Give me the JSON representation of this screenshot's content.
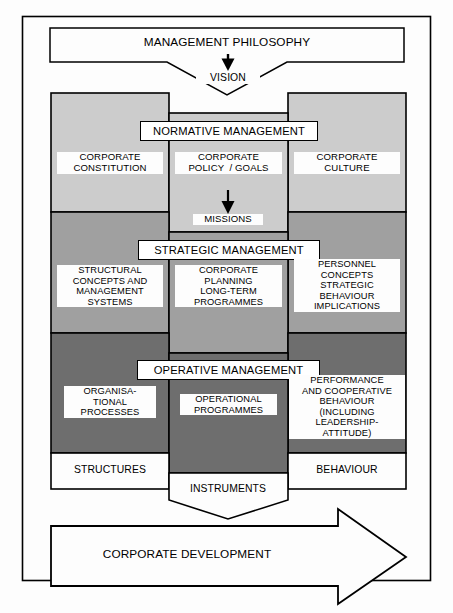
{
  "diagram": {
    "colors": {
      "outline": "#000000",
      "page_background": "#fdfdfd",
      "band_normative": "#cccccc",
      "band_strategic": "#a0a0a0",
      "band_operative": "#6e6e6e",
      "label_background": "#fdfdfd",
      "title_box_background": "#ffffff"
    },
    "top": {
      "philosophy_label": "MANAGEMENT PHILOSOPHY",
      "vision_label": "VISION"
    },
    "bands": [
      {
        "id": "normative",
        "title": "NORMATIVE MANAGEMENT",
        "shade": "#cccccc",
        "cells": {
          "left": "CORPORATE\nCONSTITUTION",
          "center": "CORPORATE\nPOLICY  / GOALS",
          "right": "CORPORATE\nCULTURE"
        },
        "connector_label": "MISSIONS"
      },
      {
        "id": "strategic",
        "title": "STRATEGIC MANAGEMENT",
        "shade": "#a0a0a0",
        "cells": {
          "left": "STRUCTURAL\nCONCEPTS AND\nMANAGEMENT\nSYSTEMS",
          "center": "CORPORATE\nPLANNING\nLONG-TERM\nPROGRAMMES",
          "right": "PERSONNEL\nCONCEPTS\nSTRATEGIC\nBEHAVIOUR\nIMPLICATIONS"
        },
        "connector_label": ""
      },
      {
        "id": "operative",
        "title": "OPERATIVE MANAGEMENT",
        "shade": "#6e6e6e",
        "cells": {
          "left": "ORGANISA-\nTIONAL\nPROCESSES",
          "center": "OPERATIONAL\nPROGRAMMES",
          "right": "PERFORMANCE\nAND COOPERATIVE\nBEHAVIOUR\n(INCLUDING\nLEADERSHIP-\nATTITUDE)"
        },
        "connector_label": ""
      }
    ],
    "footer": {
      "left_label": "STRUCTURES",
      "center_label": "INSTRUMENTS",
      "right_label": "BEHAVIOUR"
    },
    "arrow": {
      "label": "CORPORATE DEVELOPMENT"
    }
  }
}
